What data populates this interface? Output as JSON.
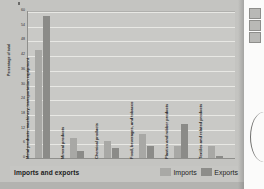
{
  "figure": {
    "caption_title": "Imports and exports",
    "y_axis_title": "Percentage of total"
  },
  "legend": {
    "position": "bottom-right",
    "entries": [
      {
        "label": "Imports",
        "color": "#a9a9a6",
        "swatch_name": "imports-swatch"
      },
      {
        "label": "Exports",
        "color": "#8d8d8a",
        "swatch_name": "exports-swatch"
      }
    ]
  },
  "side_panel": {
    "icons": [
      "panel-icon-1",
      "panel-icon-2",
      "panel-icon-3"
    ],
    "arc": "page-curl-arc"
  },
  "chart_data": {
    "type": "bar",
    "title": "Imports and exports",
    "xlabel": "",
    "ylabel": "Percentage of total",
    "ylim": [
      0,
      60
    ],
    "yticks": [
      0,
      6,
      12,
      18,
      24,
      30,
      36,
      42,
      48,
      54,
      60
    ],
    "grid": true,
    "legend_position": "bottom-right",
    "categories": [
      "Metal products, machinery, transportation equipment",
      "Mineral products",
      "Chemical products",
      "Food, beverages, and tobacco",
      "Plastics and rubber products",
      "Textiles and related products"
    ],
    "series": [
      {
        "name": "Imports",
        "color": "#a8a8a5",
        "values": [
          44,
          8,
          7,
          10,
          5,
          5
        ]
      },
      {
        "name": "Exports",
        "color": "#8b8b88",
        "values": [
          58,
          3,
          4,
          5,
          14,
          1
        ]
      }
    ]
  }
}
